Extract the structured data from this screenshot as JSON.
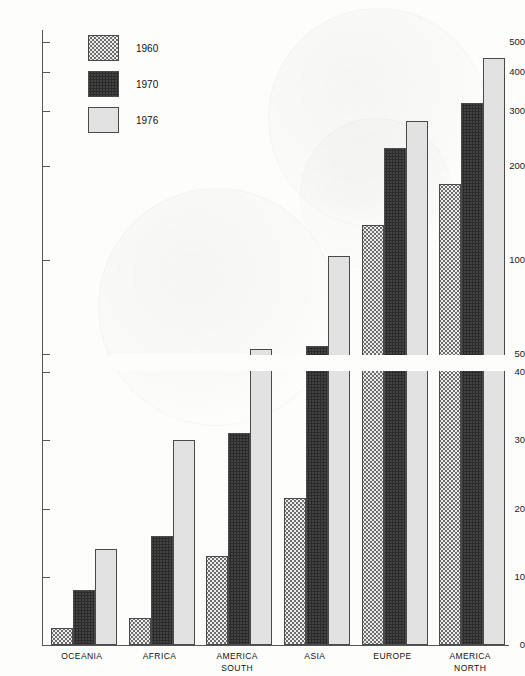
{
  "chart_data": {
    "type": "bar",
    "title": "",
    "xlabel": "",
    "ylabel": "",
    "scale": "log-broken",
    "grid": false,
    "legend_position": "top-left",
    "categories": [
      "OCEANIA",
      "AFRICA",
      "AMERICA SOUTH",
      "ASIA",
      "EUROPE",
      "AMERICA NORTH"
    ],
    "category_lines": [
      [
        "OCEANIA"
      ],
      [
        "AFRICA"
      ],
      [
        "AMERICA",
        "SOUTH"
      ],
      [
        "ASIA"
      ],
      [
        "EUROPE"
      ],
      [
        "AMERICA",
        "NORTH"
      ]
    ],
    "series": [
      {
        "name": "1960",
        "values": [
          2.5,
          4,
          13,
          21.5,
          130,
          175
        ]
      },
      {
        "name": "1970",
        "values": [
          8,
          16,
          31,
          53,
          228,
          318
        ]
      },
      {
        "name": "1976",
        "values": [
          14,
          30,
          52,
          103,
          280,
          443
        ]
      }
    ],
    "ytick_labels": [
      "0",
      "10",
      "20",
      "30",
      "40",
      "50",
      "100",
      "200",
      "300",
      "400",
      "500"
    ],
    "ytick_values": [
      0,
      10,
      20,
      30,
      40,
      50,
      100,
      200,
      300,
      400,
      500
    ],
    "axis_break_between": [
      40,
      50
    ],
    "ylim": [
      0,
      500
    ]
  },
  "legend": {
    "entries": [
      {
        "label": "1960",
        "pattern": "p1960"
      },
      {
        "label": "1970",
        "pattern": "p1970"
      },
      {
        "label": "1976",
        "pattern": "p1976"
      }
    ]
  },
  "colors": {
    "axis": "#555555",
    "text": "#111111",
    "background": "#fdfdfc",
    "series_1960": "#ececec",
    "series_1970": "#8a8a8a",
    "series_1976": "#e2e2e2",
    "bar_outline": "#4a4a4a"
  }
}
